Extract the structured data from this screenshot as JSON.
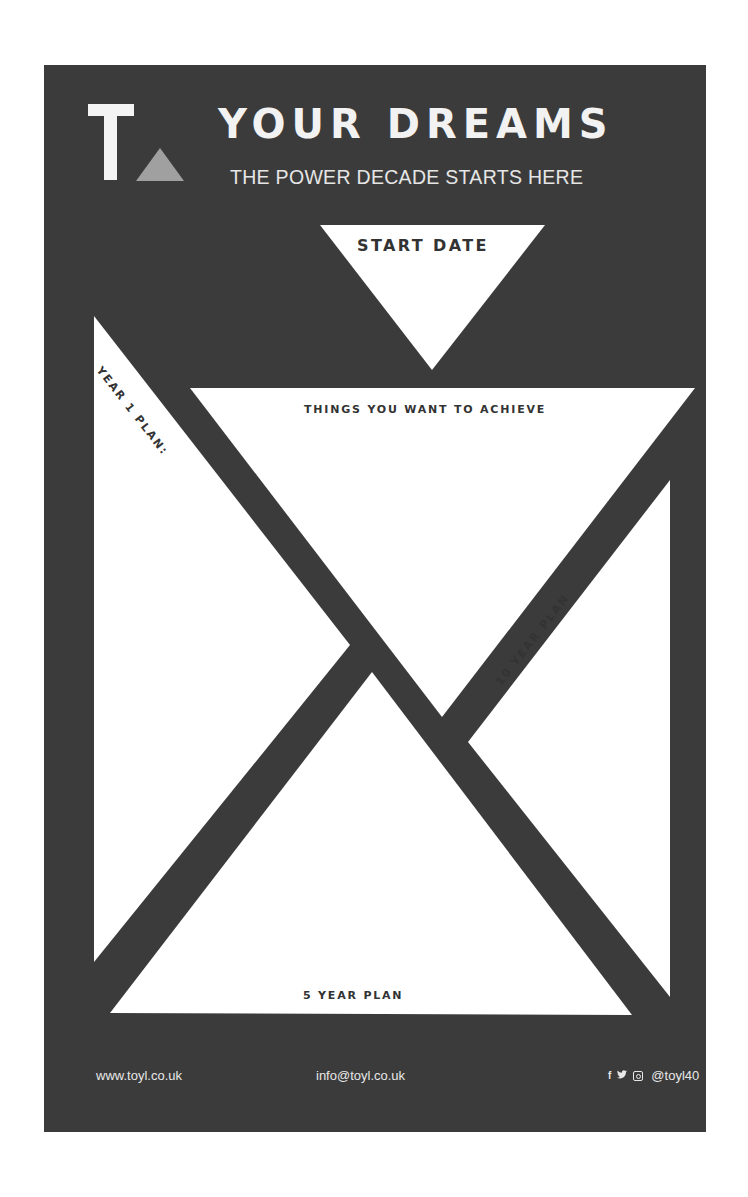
{
  "header": {
    "logo_letter": "T",
    "title": "YOUR DREAMS",
    "subtitle": "THE POWER DECADE STARTS HERE"
  },
  "sections": {
    "start_date": "START DATE",
    "things_to_achieve": "THINGS YOU WANT TO ACHIEVE",
    "year_1_plan": "YEAR 1 PLAN:",
    "ten_year_plan": "10 YEAR PLAN",
    "five_year_plan": "5 YEAR PLAN"
  },
  "footer": {
    "website": "www.toyl.co.uk",
    "email": "info@toyl.co.uk",
    "social_icons": [
      "facebook-icon",
      "twitter-icon",
      "instagram-icon"
    ],
    "facebook_glyph": "f",
    "twitter_glyph": "🐦",
    "handle": "@toyl40"
  },
  "colors": {
    "panel": "#3b3b3b",
    "shape_fill": "#ffffff",
    "logo_triangle": "#a0a0a0",
    "text_dark": "#333333",
    "text_light": "#f2f2f2"
  }
}
